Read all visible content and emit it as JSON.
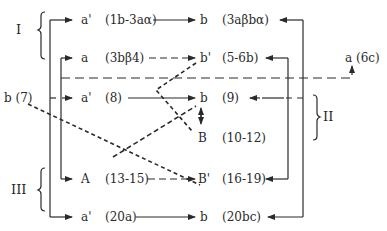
{
  "diagram": {
    "groups": [
      {
        "id": "I",
        "label": "I"
      },
      {
        "id": "II",
        "label": "II"
      },
      {
        "id": "III",
        "label": "III"
      }
    ],
    "rows": [
      {
        "left": "a'",
        "left_ref": "(1b-3aα)",
        "right": "b",
        "right_ref": "(3aβbα)",
        "style": "solid"
      },
      {
        "left": "a",
        "left_ref": "(3bβ4)",
        "right": "b'",
        "right_ref": "(5-6b)",
        "style": "dashed"
      },
      {
        "left": "a'",
        "left_ref": "(8)",
        "right": "b",
        "right_ref": "(9)",
        "style": "solid"
      },
      {
        "left": "",
        "left_ref": "",
        "right": "B",
        "right_ref": "(10-12)",
        "style": "double-arrow"
      },
      {
        "left": "A",
        "left_ref": "(13-15)",
        "right": "B'",
        "right_ref": "(16-19)",
        "style": "dashed"
      },
      {
        "left": "a'",
        "left_ref": "(20a)",
        "right": "b",
        "right_ref": "(20bc)",
        "style": "solid"
      }
    ],
    "outliers": {
      "b7": "b (7)",
      "a6c": "a (6c)"
    },
    "colors": {
      "line": "#2a2a2a"
    }
  }
}
